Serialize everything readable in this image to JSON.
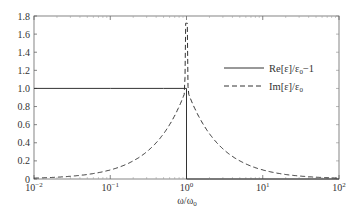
{
  "chart_data": {
    "type": "line",
    "title": "",
    "xlabel": "ω/ω0",
    "ylabel": "",
    "xscale": "log",
    "xlim": [
      0.01,
      100
    ],
    "ylim": [
      0,
      1.8
    ],
    "grid": false,
    "legend_position": "upper right (middle-right region)",
    "x_ticks": [
      "10^-2",
      "10^-1",
      "10^0",
      "10^1",
      "10^2"
    ],
    "y_ticks": [
      "0",
      "0.2",
      "0.4",
      "0.6",
      "0.8",
      "1.0",
      "1.2",
      "1.4",
      "1.6",
      "1.8"
    ],
    "series": [
      {
        "name": "Re[ε]/ε0−1",
        "style": "solid",
        "x": [
          0.01,
          0.1,
          0.5,
          0.9,
          0.99,
          1.0,
          1.0,
          2,
          10,
          100
        ],
        "values": [
          1.0,
          1.0,
          1.0,
          1.0,
          1.0,
          1.0,
          0,
          0,
          0,
          0
        ]
      },
      {
        "name": "Im[ε]/ε0",
        "style": "dashed",
        "x": [
          0.01,
          0.03,
          0.1,
          0.2,
          0.4,
          0.6,
          0.8,
          0.9,
          0.95,
          1.0,
          1.05,
          1.1,
          1.25,
          1.6,
          2.5,
          5,
          10,
          30,
          100
        ],
        "values": [
          0.01,
          0.03,
          0.1,
          0.2,
          0.38,
          0.56,
          0.8,
          1.0,
          1.25,
          1.72,
          1.2,
          0.95,
          0.8,
          0.62,
          0.4,
          0.2,
          0.1,
          0.03,
          0.01
        ]
      }
    ]
  },
  "axes": {
    "xlabel_main": "ω/ω",
    "xlabel_sub": "0",
    "x_tick_labels": [
      {
        "base": "10",
        "exp": "−2"
      },
      {
        "base": "10",
        "exp": "−1"
      },
      {
        "base": "10",
        "exp": "0"
      },
      {
        "base": "10",
        "exp": "1"
      },
      {
        "base": "10",
        "exp": "2"
      }
    ],
    "y_tick_labels": [
      "0",
      "0.2",
      "0.4",
      "0.6",
      "0.8",
      "1.0",
      "1.2",
      "1.4",
      "1.6",
      "1.8"
    ]
  },
  "legend": {
    "items": [
      {
        "label": "Re[ε]/ε0−1",
        "main": "Re[ε]/ε",
        "sub": "0",
        "tail": "−1",
        "style": "solid"
      },
      {
        "label": "Im[ε]/ε0",
        "main": "Im[ε]/ε",
        "sub": "0",
        "tail": "",
        "style": "dashed"
      }
    ]
  },
  "colors": {
    "line": "#333333",
    "axis": "#555555",
    "background": "#ffffff"
  }
}
